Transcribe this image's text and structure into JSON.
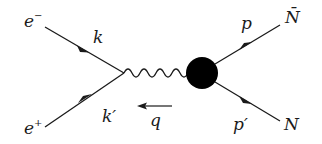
{
  "diagram": {
    "type": "feynman-diagram",
    "colors": {
      "line": "#1a1a1a",
      "background": "#ffffff",
      "blob": "#000000"
    },
    "particles": {
      "incoming_electron": {
        "symbol": "e",
        "charge": "−",
        "momentum": "k"
      },
      "incoming_positron": {
        "symbol": "e",
        "charge": "+",
        "momentum": "k′"
      },
      "photon": {
        "momentum": "q"
      },
      "antinucleon": {
        "symbol": "N̄",
        "momentum": "p"
      },
      "nucleon": {
        "symbol": "N",
        "momentum": "p′"
      }
    },
    "labels": {
      "e_minus": "e",
      "e_minus_sup": "−",
      "e_plus": "e",
      "e_plus_sup": "+",
      "k": "k",
      "k_prime": "k′",
      "q": "q",
      "p": "p",
      "p_prime": "p′",
      "n_bar": "N̄",
      "n": "N"
    }
  }
}
